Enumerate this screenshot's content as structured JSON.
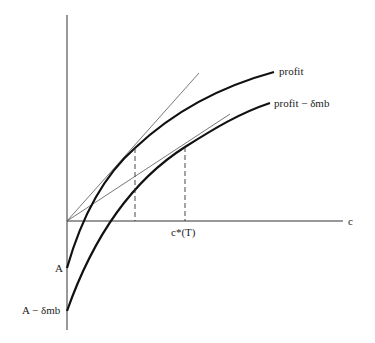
{
  "diagram": {
    "type": "economics-curve-diagram",
    "axes": {
      "x_label": "c",
      "y_intercepts": [
        "A",
        "A − δmb"
      ]
    },
    "curves": [
      {
        "name": "profit",
        "label": "profit"
      },
      {
        "name": "profit-minus-delta-mb",
        "label": "profit − δmb"
      }
    ],
    "tangent_lines": 2,
    "dashed_markers": 2,
    "marker_label": "c*(T)",
    "colors": {
      "line": "#111111",
      "thin_line": "#555555",
      "background": "#ffffff"
    }
  }
}
